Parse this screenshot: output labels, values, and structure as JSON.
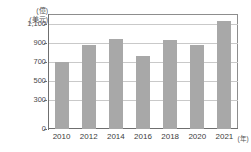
{
  "chart_data": {
    "type": "bar",
    "title": "",
    "subtitle": "",
    "xlabel": "年",
    "ylabel": "億美元",
    "unit_caption_lines": [
      "(億)",
      "(美元)"
    ],
    "xaxis_unit_suffix": "(年)",
    "categories": [
      "2010",
      "2012",
      "2014",
      "2016",
      "2018",
      "2020",
      "2021"
    ],
    "values": [
      700,
      880,
      940,
      760,
      930,
      875,
      1130
    ],
    "ylim": [
      0,
      1200
    ],
    "yticks": [
      0,
      300,
      500,
      700,
      900,
      1100
    ],
    "ytick_labels": [
      "0",
      "300",
      "500",
      "700",
      "900",
      "1,100"
    ],
    "grid": true,
    "grid_axis": "y",
    "legend": false,
    "legend_position": "none",
    "bar_color": "#a8a8a8",
    "grid_color": "#c9c9c9",
    "axis_color": "#6f6f6f",
    "frame_color": "#8d8d8d",
    "text_color": "#3d3d3d"
  }
}
